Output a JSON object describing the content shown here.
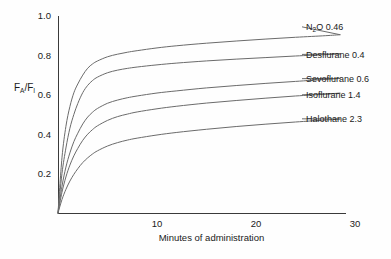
{
  "chart_data": {
    "type": "line",
    "title": "",
    "xlabel": "Minutes of administration",
    "ylabel": "FA/FI",
    "ylabel_parts": {
      "f1": "F",
      "sub1": "A",
      "slash": "/F",
      "sub2": "I"
    },
    "xlim": [
      0,
      31.5
    ],
    "ylim": [
      0,
      1.06
    ],
    "grid": false,
    "legend_position": "right-inline-labels",
    "xticks": [
      10,
      20,
      30
    ],
    "xtick_labels": [
      "10",
      "20",
      "30"
    ],
    "yticks": [
      0.2,
      0.4,
      0.6,
      0.8,
      1.0
    ],
    "ytick_labels": [
      "0.2",
      "0.4",
      "0.6",
      "0.8",
      "1.0"
    ],
    "x": [
      0,
      0.4,
      0.8,
      1.2,
      1.6,
      2,
      2.5,
      3,
      3.5,
      4,
      5,
      6,
      7,
      8,
      10,
      12,
      15,
      18,
      21,
      24,
      27,
      28.5
    ],
    "series": [
      {
        "name": "N2O 0.46",
        "label": "N₂O 0.46",
        "label_pre": "N",
        "label_sub": "2",
        "label_post": "O 0.46",
        "blood_gas_coefficient": 0.46,
        "color": "#6b6b6b",
        "values": [
          0.0,
          0.28,
          0.44,
          0.54,
          0.61,
          0.655,
          0.7,
          0.735,
          0.757,
          0.772,
          0.793,
          0.806,
          0.816,
          0.824,
          0.838,
          0.849,
          0.862,
          0.873,
          0.883,
          0.892,
          0.9,
          0.905
        ],
        "label_y": 0.945
      },
      {
        "name": "Desflurane 0.4",
        "label": "Desflurane 0.4",
        "blood_gas_coefficient": 0.4,
        "color": "#6b6b6b",
        "values": [
          0.0,
          0.2,
          0.33,
          0.43,
          0.5,
          0.556,
          0.611,
          0.648,
          0.673,
          0.69,
          0.712,
          0.725,
          0.734,
          0.741,
          0.752,
          0.761,
          0.772,
          0.781,
          0.789,
          0.797,
          0.804,
          0.808
        ],
        "label_y": 0.805
      },
      {
        "name": "Sevoflurane 0.6",
        "label": "Sevoflurane 0.6",
        "blood_gas_coefficient": 0.6,
        "color": "#6b6b6b",
        "values": [
          0.0,
          0.135,
          0.233,
          0.305,
          0.362,
          0.405,
          0.452,
          0.487,
          0.512,
          0.531,
          0.557,
          0.573,
          0.585,
          0.594,
          0.609,
          0.62,
          0.635,
          0.647,
          0.658,
          0.668,
          0.678,
          0.683
        ],
        "label_y": 0.682
      },
      {
        "name": "Isoflurane 1.4",
        "label": "Isoflurane 1.4",
        "blood_gas_coefficient": 1.4,
        "color": "#6b6b6b",
        "values": [
          0.0,
          0.105,
          0.183,
          0.243,
          0.29,
          0.328,
          0.369,
          0.4,
          0.424,
          0.443,
          0.47,
          0.489,
          0.502,
          0.513,
          0.529,
          0.542,
          0.558,
          0.571,
          0.583,
          0.594,
          0.603,
          0.608
        ],
        "label_y": 0.6
      },
      {
        "name": "Halothane 2.3",
        "label": "Halothane 2.3",
        "blood_gas_coefficient": 2.3,
        "color": "#6b6b6b",
        "values": [
          0.0,
          0.068,
          0.12,
          0.162,
          0.196,
          0.225,
          0.256,
          0.28,
          0.3,
          0.316,
          0.34,
          0.357,
          0.37,
          0.38,
          0.396,
          0.409,
          0.425,
          0.439,
          0.451,
          0.462,
          0.472,
          0.477
        ],
        "label_y": 0.478
      }
    ]
  }
}
